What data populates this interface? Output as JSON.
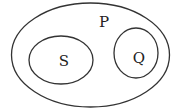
{
  "diagram": {
    "type": "euler",
    "stroke_color": "#333333",
    "background": "#ffffff",
    "sets": [
      {
        "id": "P",
        "label": "P",
        "contains": [
          "S",
          "Q"
        ]
      },
      {
        "id": "S",
        "label": "S",
        "contains": []
      },
      {
        "id": "Q",
        "label": "Q",
        "contains": []
      }
    ],
    "relations": [
      "S is a subset of P",
      "Q is a subset of P",
      "S and Q are disjoint"
    ]
  }
}
